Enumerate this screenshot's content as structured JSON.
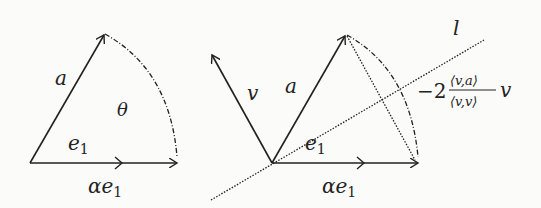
{
  "left": {
    "a_label": "a",
    "theta_label": "θ",
    "e1_label": "e",
    "e1_sub": "1",
    "alpha_e1_label": "αe",
    "alpha_e1_sub": "1"
  },
  "right": {
    "v_label": "v",
    "a_label": "a",
    "e1_label": "e",
    "e1_sub": "1",
    "alpha_e1_label": "αe",
    "alpha_e1_sub": "1",
    "l_label": "l",
    "formula_coef": "−2",
    "formula_num": "⟨v,a⟩",
    "formula_den": "⟨v,v⟩",
    "formula_v": "v"
  },
  "colors": {
    "stroke": "#222222",
    "background": "#fbfbf9"
  }
}
